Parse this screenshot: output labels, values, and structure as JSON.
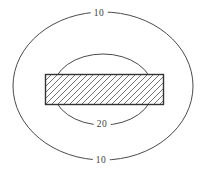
{
  "figure": {
    "labels": {
      "outer_top": "10",
      "inner_bottom": "20",
      "outer_bottom": "10"
    },
    "contours": [
      {
        "level": 10,
        "shape": "outer-ellipse",
        "label_positions": [
          "top",
          "bottom"
        ]
      },
      {
        "level": 20,
        "shape": "inner-ellipse",
        "label_positions": [
          "bottom"
        ]
      }
    ],
    "colors": {
      "background": "#ffffff",
      "contour_line": "#4a4a4a",
      "rectangle_border": "#333333",
      "hatch_line": "#4f4f4f",
      "label_text": "#3d3d3d"
    }
  }
}
